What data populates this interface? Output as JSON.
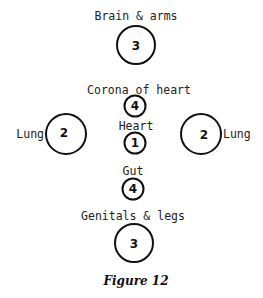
{
  "nodes": [
    {
      "id": "brain-arms",
      "label": "Brain & arms",
      "value": "3"
    },
    {
      "id": "corona-of-heart",
      "label": "Corona of heart",
      "value": "4"
    },
    {
      "id": "heart",
      "label": "Heart",
      "value": "1"
    },
    {
      "id": "left-lung",
      "label": "Lung",
      "value": "2"
    },
    {
      "id": "right-lung",
      "label": "Lung",
      "value": "2"
    },
    {
      "id": "gut",
      "label": "Gut",
      "value": "4"
    },
    {
      "id": "genitals-legs",
      "label": "Genitals & legs",
      "value": "3"
    }
  ],
  "caption": "Figure 12"
}
